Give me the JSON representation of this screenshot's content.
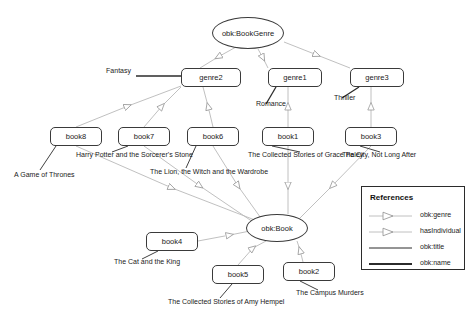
{
  "diagram": {
    "classes": [
      {
        "id": "bookgenre",
        "label": "obk:BookGenre",
        "x": 248,
        "y": 33,
        "rx": 36,
        "ry": 16
      },
      {
        "id": "book",
        "label": "obk:Book",
        "x": 277,
        "y": 228,
        "rx": 31,
        "ry": 14
      }
    ],
    "genres": [
      {
        "id": "genre2",
        "label": "genre2",
        "x": 181,
        "y": 68,
        "w": 60,
        "h": 19
      },
      {
        "id": "genre1",
        "label": "genre1",
        "x": 268,
        "y": 68,
        "w": 54,
        "h": 19
      },
      {
        "id": "genre3",
        "label": "genre3",
        "x": 350,
        "y": 68,
        "w": 54,
        "h": 19
      }
    ],
    "books": [
      {
        "id": "book8",
        "label": "book8",
        "x": 50,
        "y": 127,
        "w": 52,
        "h": 19
      },
      {
        "id": "book7",
        "label": "book7",
        "x": 118,
        "y": 127,
        "w": 52,
        "h": 19
      },
      {
        "id": "book6",
        "label": "book6",
        "x": 187,
        "y": 127,
        "w": 52,
        "h": 19
      },
      {
        "id": "book1",
        "label": "book1",
        "x": 262,
        "y": 127,
        "w": 52,
        "h": 19
      },
      {
        "id": "book3",
        "label": "book3",
        "x": 345,
        "y": 127,
        "w": 52,
        "h": 19
      },
      {
        "id": "book4",
        "label": "book4",
        "x": 146,
        "y": 232,
        "w": 52,
        "h": 19
      },
      {
        "id": "book5",
        "label": "book5",
        "x": 212,
        "y": 265,
        "w": 52,
        "h": 19
      },
      {
        "id": "book2",
        "label": "book2",
        "x": 283,
        "y": 262,
        "w": 52,
        "h": 19
      }
    ],
    "genre_names": [
      {
        "id": "fantasy",
        "label": "Fantasy",
        "x": 131,
        "y": 74,
        "anchor": "end"
      },
      {
        "id": "romance",
        "label": "Romance",
        "x": 256,
        "y": 107,
        "anchor": "start"
      },
      {
        "id": "thriller",
        "label": "Thriller",
        "x": 334,
        "y": 101,
        "anchor": "start"
      }
    ],
    "book_titles": [
      {
        "id": "title-book8",
        "label": "A Game of Thrones",
        "x": 14,
        "y": 178
      },
      {
        "id": "title-book7",
        "label": "Harry Potter and the Sorcerer's Stone",
        "x": 76,
        "y": 158
      },
      {
        "id": "title-book6",
        "label": "The Lion, the Witch and the Wardrobe",
        "x": 150,
        "y": 175
      },
      {
        "id": "title-book1",
        "label": "The Collected Stories of Grace Paley",
        "x": 248,
        "y": 158
      },
      {
        "id": "title-book3",
        "label": "The City, Not Long After",
        "x": 342,
        "y": 158
      },
      {
        "id": "title-book4",
        "label": "The Cat and the King",
        "x": 114,
        "y": 265
      },
      {
        "id": "title-book5",
        "label": "The Collected Stories of Amy Hempel",
        "x": 168,
        "y": 305
      },
      {
        "id": "title-book2",
        "label": "The Campus Murders",
        "x": 296,
        "y": 296
      }
    ]
  },
  "legend": {
    "title": "References",
    "items": [
      {
        "id": "obk-genre",
        "label": "obk:genre",
        "style": "arrow-light"
      },
      {
        "id": "hasindividual",
        "label": "hasIndividual",
        "style": "arrow-light"
      },
      {
        "id": "obk-title",
        "label": "obk:title",
        "style": "line-thin"
      },
      {
        "id": "obk-name",
        "label": "obk:name",
        "style": "line-thick"
      }
    ]
  },
  "colors": {
    "relation_edge": "#b9b9b9",
    "literal_edge": "#2b2b2b",
    "node_stroke": "#3a3a3a",
    "text": "#1a1a1a",
    "background": "#ffffff"
  }
}
